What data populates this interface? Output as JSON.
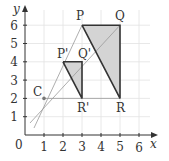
{
  "axes": {
    "x_label": "x",
    "y_label": "y",
    "origin_label": "0",
    "x_ticks": [
      "1",
      "2",
      "3",
      "4",
      "5",
      "6"
    ],
    "y_ticks": [
      "1",
      "2",
      "3",
      "4",
      "5",
      "6"
    ]
  },
  "points": {
    "C": {
      "label": "C",
      "x": 1,
      "y": 2
    },
    "P": {
      "label": "P",
      "x": 3,
      "y": 6
    },
    "Q": {
      "label": "Q",
      "x": 5,
      "y": 6
    },
    "R": {
      "label": "R",
      "x": 5,
      "y": 2
    },
    "P1": {
      "label": "P'",
      "x": 2,
      "y": 4
    },
    "Q1": {
      "label": "Q'",
      "x": 3,
      "y": 4
    },
    "R1": {
      "label": "R'",
      "x": 3,
      "y": 2
    }
  },
  "colors": {
    "grid": "#e2e2e2",
    "axis": "#333333",
    "shape_fill": "#d4d4d4",
    "shape_stroke": "#333333",
    "ray": "#999999"
  }
}
